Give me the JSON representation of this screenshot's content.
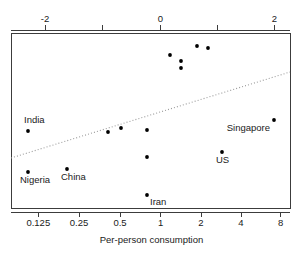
{
  "chart_data": {
    "type": "scatter",
    "title": "",
    "xlabel": "Per-person consumption",
    "ylabel": "",
    "top_axis": {
      "label": "",
      "tick_values": [
        -2,
        -1,
        0,
        1,
        2
      ],
      "tick_labels": [
        "-2",
        "",
        "0",
        "",
        "2"
      ],
      "scale": "log2",
      "range": [
        -2.6,
        2.26
      ]
    },
    "bottom_axis": {
      "label": "Per-person consumption",
      "tick_values": [
        0.125,
        0.25,
        0.5,
        1,
        2,
        4,
        8
      ],
      "tick_labels": [
        "0.125",
        "0.25",
        "0.5",
        "1",
        "2",
        "4",
        "8"
      ],
      "scale": "log2",
      "range": [
        0.107,
        9.5
      ]
    },
    "ylim": [
      0,
      1
    ],
    "grid": false,
    "legend": false,
    "points": [
      {
        "id": "p1",
        "label": "India",
        "x_log2": -2.0,
        "x_value": 0.125,
        "px": 28,
        "py": 131,
        "label_dx": -4,
        "label_dy": -8,
        "label_anchor": "start"
      },
      {
        "id": "p2",
        "label": "Nigeria",
        "x_log2": -2.0,
        "x_value": 0.125,
        "px": 28,
        "py": 172,
        "label_dx": -8,
        "label_dy": 11,
        "label_anchor": "start"
      },
      {
        "id": "p3",
        "label": "China",
        "x_log2": -1.32,
        "x_value": 0.2,
        "px": 67,
        "py": 169,
        "label_dx": -6,
        "label_dy": 11,
        "label_anchor": "start"
      },
      {
        "id": "p4",
        "label": "",
        "x_log2": -0.72,
        "x_value": 0.42,
        "px": 108,
        "py": 132,
        "label_dx": 0,
        "label_dy": 0,
        "label_anchor": "start"
      },
      {
        "id": "p5",
        "label": "",
        "x_log2": -0.5,
        "x_value": 0.5,
        "px": 121,
        "py": 128,
        "label_dx": 0,
        "label_dy": 0,
        "label_anchor": "start"
      },
      {
        "id": "p6",
        "label": "",
        "x_log2": -0.24,
        "x_value": 0.8,
        "px": 147,
        "py": 130,
        "label_dx": 0,
        "label_dy": 0,
        "label_anchor": "start"
      },
      {
        "id": "p7",
        "label": "",
        "x_log2": -0.24,
        "x_value": 0.8,
        "px": 147,
        "py": 157,
        "label_dx": 0,
        "label_dy": 0,
        "label_anchor": "start"
      },
      {
        "id": "p8",
        "label": "Iran",
        "x_log2": -0.24,
        "x_value": 0.8,
        "px": 147,
        "py": 195,
        "label_dx": 3,
        "label_dy": 10,
        "label_anchor": "start"
      },
      {
        "id": "p9",
        "label": "",
        "x_log2": 0.18,
        "x_value": 1.13,
        "px": 170,
        "py": 55,
        "label_dx": 0,
        "label_dy": 0,
        "label_anchor": "start"
      },
      {
        "id": "p10",
        "label": "",
        "x_log2": 0.36,
        "x_value": 1.28,
        "px": 181,
        "py": 61,
        "label_dx": 0,
        "label_dy": 0,
        "label_anchor": "start"
      },
      {
        "id": "p11",
        "label": "",
        "x_log2": 0.36,
        "x_value": 1.28,
        "px": 181,
        "py": 68,
        "label_dx": 0,
        "label_dy": 0,
        "label_anchor": "start"
      },
      {
        "id": "p12",
        "label": "",
        "x_log2": 0.64,
        "x_value": 1.56,
        "px": 197,
        "py": 46,
        "label_dx": 0,
        "label_dy": 0,
        "label_anchor": "start"
      },
      {
        "id": "p13",
        "label": "",
        "x_log2": 0.83,
        "x_value": 1.78,
        "px": 208,
        "py": 48,
        "label_dx": 0,
        "label_dy": 0,
        "label_anchor": "start"
      },
      {
        "id": "p14",
        "label": "US",
        "x_log2": 1.06,
        "x_value": 2.08,
        "px": 222,
        "py": 152,
        "label_dx": -6,
        "label_dy": 11,
        "label_anchor": "start"
      },
      {
        "id": "p15",
        "label": "Singapore",
        "x_log2": 1.98,
        "x_value": 3.95,
        "px": 274,
        "py": 120,
        "label_dx": -4,
        "label_dy": 11,
        "label_anchor": "end"
      }
    ],
    "trend_line": {
      "style": "dotted",
      "color": "#9a9a9a",
      "x1_px": 11,
      "y1_px": 158,
      "x2_px": 290,
      "y2_px": 72
    },
    "frame": {
      "left": 11,
      "top": 33,
      "right": 290,
      "bottom": 208
    }
  }
}
